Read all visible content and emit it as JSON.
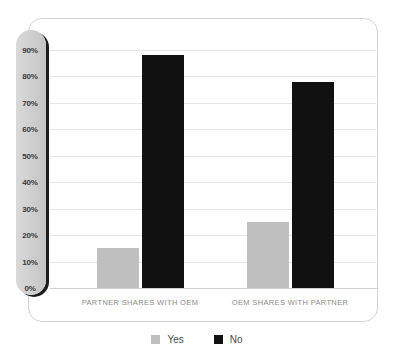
{
  "chart_data": {
    "type": "bar",
    "title": "",
    "xlabel": "",
    "ylabel": "",
    "ylim": [
      0,
      90
    ],
    "grid": true,
    "legend_position": "bottom",
    "categories": [
      "PARTNER SHARES WITH OEM",
      "OEM SHARES WITH PARTNER"
    ],
    "yticks": [
      "0%",
      "10%",
      "20%",
      "30%",
      "40%",
      "50%",
      "60%",
      "70%",
      "80%",
      "90%"
    ],
    "ytick_values": [
      0,
      10,
      20,
      30,
      40,
      50,
      60,
      70,
      80,
      90
    ],
    "series": [
      {
        "name": "Yes",
        "color": "#bfbfbf",
        "values": [
          15,
          25
        ]
      },
      {
        "name": "No",
        "color": "#111111",
        "values": [
          88,
          78
        ]
      }
    ]
  },
  "legend": {
    "items": [
      {
        "label": "Yes",
        "swatch": "yes"
      },
      {
        "label": "No",
        "swatch": "no"
      }
    ]
  },
  "colors": {
    "yes": "#bfbfbf",
    "no": "#111111",
    "gridline": "#e6e6e6",
    "card_border": "#d2d2d2",
    "axis_pill": "#cfcfcf",
    "axis_pill_shadow": "#1d1d1d",
    "category_text": "#8a8a8a",
    "tick_text": "#3a3a3a"
  }
}
